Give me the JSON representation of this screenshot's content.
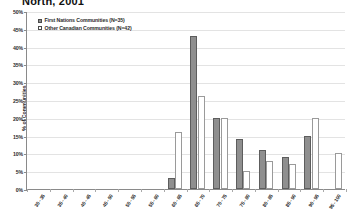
{
  "chart_data": {
    "type": "bar",
    "title": "North, 2001",
    "xlabel": "",
    "ylabel": "% of Communities",
    "ylim": [
      0,
      50
    ],
    "ytick_labels": [
      "0%",
      "5%",
      "10%",
      "15%",
      "20%",
      "25%",
      "30%",
      "35%",
      "40%",
      "45%",
      "50%"
    ],
    "ytick_values": [
      0,
      5,
      10,
      15,
      20,
      25,
      30,
      35,
      40,
      45,
      50
    ],
    "grid": true,
    "legend_position": "top-left",
    "categories": [
      "30 - 35",
      "35 - 40",
      "40 - 45",
      "45 - 50",
      "50 - 55",
      "55 - 60",
      "60 - 65",
      "65 - 70",
      "70 - 75",
      "75 - 80",
      "80 - 85",
      "85 - 90",
      "90 - 95",
      "95 - 100"
    ],
    "series": [
      {
        "name": "First Nations Communities (N=35)",
        "color": "#8f8f8f",
        "values": [
          0,
          0,
          0,
          0,
          0,
          0,
          3,
          43,
          20,
          14,
          11,
          9,
          15,
          0
        ]
      },
      {
        "name": "Other Canadian Communities (N=42)",
        "color": "#ffffff",
        "values": [
          0,
          0,
          0,
          0,
          0,
          0,
          16,
          26,
          20,
          5,
          8,
          7,
          20,
          10
        ]
      }
    ]
  },
  "legend": {
    "items": [
      {
        "label": "First Nations Communities (N=35)",
        "swatch": "fn"
      },
      {
        "label": "Other Canadian Communities (N=42)",
        "swatch": "oc"
      }
    ]
  }
}
